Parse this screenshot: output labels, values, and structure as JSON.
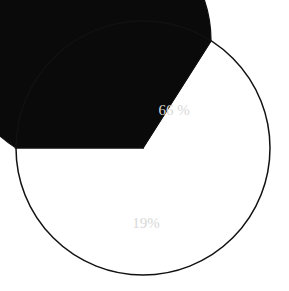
{
  "chart_data": {
    "type": "pie",
    "title": "",
    "center": [
      143,
      148
    ],
    "radius": 127,
    "start_angle_deg": 180,
    "direction": "clockwise-visual",
    "legend": "none",
    "slices": [
      {
        "label": "66 %",
        "value": 66,
        "color": "#0a0a0a",
        "label_color": "#d8d8d8"
      },
      {
        "label": "19%",
        "value": 19,
        "color": "#b4b4b4",
        "label_color": "#eeeeee"
      },
      {
        "label": "",
        "value": 15,
        "color": "#ffffff",
        "label_color": ""
      }
    ],
    "outline_color": "#111111"
  }
}
